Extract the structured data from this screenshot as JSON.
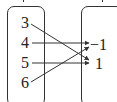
{
  "diagram": {
    "type": "mapping",
    "domain_set": {
      "elements": [
        "3",
        "4",
        "5",
        "6"
      ]
    },
    "codomain_set": {
      "elements": [
        "−1",
        "1"
      ]
    },
    "mappings": [
      {
        "from": "3",
        "to": "1"
      },
      {
        "from": "4",
        "to": "−1"
      },
      {
        "from": "5",
        "to": "1"
      },
      {
        "from": "6",
        "to": "−1"
      }
    ],
    "colors": {
      "stroke": "#333333",
      "text": "#222222",
      "background": "#ffffff"
    }
  }
}
